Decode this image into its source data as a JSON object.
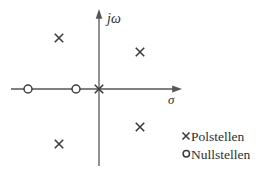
{
  "diagram": {
    "type": "pole-zero-plot",
    "colors": {
      "background": "#ffffff",
      "axis": "#565656",
      "mark": "#3c3c3c",
      "text": "#2e2e2e"
    },
    "axes": {
      "y_label": "jω",
      "x_label": "σ"
    },
    "poles": [
      {
        "x": 59,
        "y": 38
      },
      {
        "x": 140,
        "y": 52
      },
      {
        "x": 99,
        "y": 89
      },
      {
        "x": 140,
        "y": 127
      },
      {
        "x": 59,
        "y": 144
      }
    ],
    "zeros": [
      {
        "x": 28,
        "y": 89
      },
      {
        "x": 76,
        "y": 89
      }
    ],
    "legend": [
      {
        "marker": "×",
        "label": "Polstellen"
      },
      {
        "marker": "○",
        "label": "Nullstellen"
      }
    ]
  }
}
